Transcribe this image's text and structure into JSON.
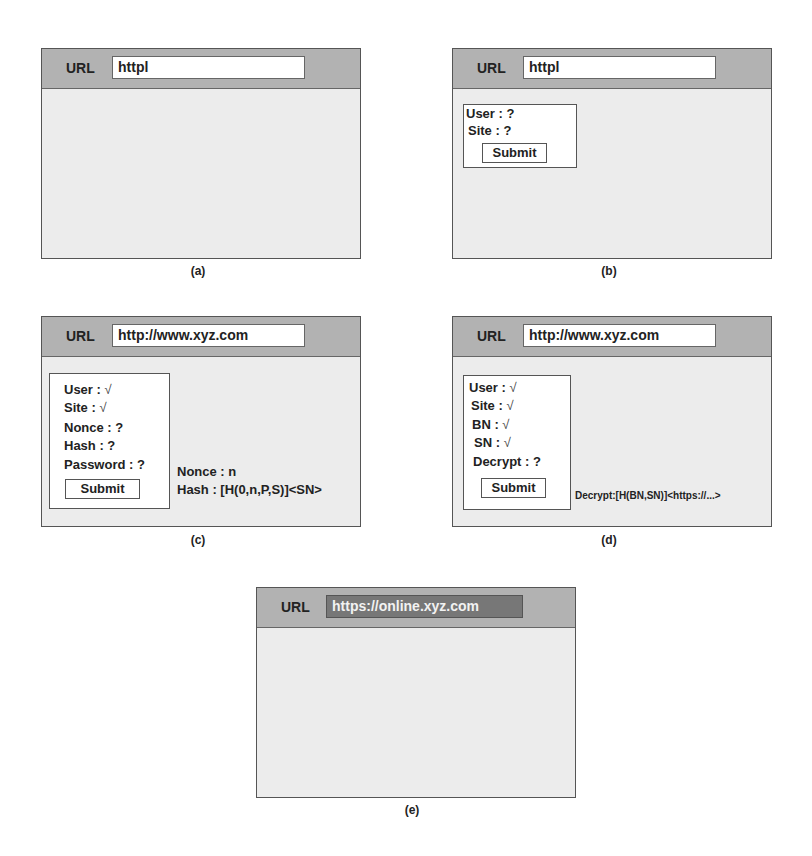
{
  "panels": {
    "a": {
      "caption": "(a)",
      "url_label": "URL",
      "url_value": "httpl"
    },
    "b": {
      "caption": "(b)",
      "url_label": "URL",
      "url_value": "httpl",
      "form": {
        "fields": [
          "User : ?",
          "Site : ?"
        ],
        "submit_label": "Submit"
      }
    },
    "c": {
      "caption": "(c)",
      "url_label": "URL",
      "url_value": "http://www.xyz.com",
      "form": {
        "fields": [
          {
            "label": "User : ",
            "status": "√"
          },
          {
            "label": "Site : ",
            "status": "√"
          },
          {
            "label": "Nonce : ?",
            "status": ""
          },
          {
            "label": "Hash : ?",
            "status": ""
          },
          {
            "label": "Password : ?",
            "status": ""
          }
        ],
        "submit_label": "Submit"
      },
      "notes": [
        "Nonce : n",
        "Hash : [H(0,n,P,S)]<SN>"
      ]
    },
    "d": {
      "caption": "(d)",
      "url_label": "URL",
      "url_value": "http://www.xyz.com",
      "form": {
        "fields": [
          {
            "label": "User : ",
            "status": "√"
          },
          {
            "label": "Site : ",
            "status": "√"
          },
          {
            "label": "BN : ",
            "status": "√"
          },
          {
            "label": "SN : ",
            "status": "√"
          },
          {
            "label": "Decrypt : ?",
            "status": ""
          }
        ],
        "submit_label": "Submit"
      },
      "notes": [
        "Decrypt:[H(BN,SN)]<https://...>"
      ]
    },
    "e": {
      "caption": "(e)",
      "url_label": "URL",
      "url_value": "https://online.xyz.com"
    }
  },
  "colors": {
    "header": "#b2b2b2",
    "body": "#ececec",
    "secure_url_bg": "#777777"
  }
}
